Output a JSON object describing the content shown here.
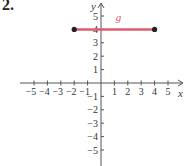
{
  "problem_number": "2.",
  "chart_data": {
    "type": "line",
    "title": "",
    "xlabel": "x",
    "ylabel": "y",
    "xlim": [
      -5.5,
      5.5
    ],
    "ylim": [
      -5.5,
      5.5
    ],
    "grid": false,
    "x_ticks": [
      -5,
      -4,
      -3,
      -2,
      -1,
      1,
      2,
      3,
      4,
      5
    ],
    "y_ticks": [
      -5,
      -4,
      -3,
      -2,
      -1,
      1,
      2,
      3,
      4,
      5
    ],
    "x_tick_labels": [
      "−5",
      "−4",
      "−3",
      "−2",
      "−1",
      "1",
      "2",
      "3",
      "4",
      "5"
    ],
    "y_tick_labels": [
      "−5",
      "−4",
      "−3",
      "−2",
      "−1",
      "1",
      "2",
      "3",
      "4",
      "5"
    ],
    "series": [
      {
        "name": "g",
        "color": "#e05a6e",
        "points": [
          {
            "x": -2,
            "y": 4
          },
          {
            "x": 4,
            "y": 4
          }
        ],
        "endpoints": "closed"
      }
    ],
    "annotations": [
      {
        "text": "g",
        "x": 1.3,
        "y": 4.6
      }
    ]
  },
  "colors": {
    "axis": "#555555",
    "function": "#e05a6e",
    "endpoint": "#222222"
  }
}
